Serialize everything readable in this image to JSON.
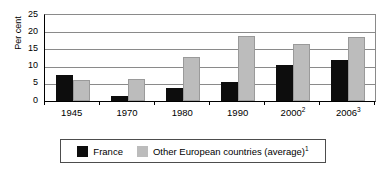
{
  "chart_data": {
    "type": "bar",
    "title": "",
    "subtitle": "",
    "xlabel": "",
    "ylabel": "Per cent",
    "ylim": [
      0,
      25
    ],
    "yticks": [
      0,
      5,
      10,
      15,
      20,
      25
    ],
    "ytick_labels": [
      "0",
      "5",
      "10",
      "15",
      "20",
      "25"
    ],
    "grid": true,
    "legend_position": "bottom",
    "categories": [
      "1945",
      "1970",
      "1980",
      "1990",
      "2000",
      "2006"
    ],
    "category_labels": [
      {
        "text": "1945",
        "sup": ""
      },
      {
        "text": "1970",
        "sup": ""
      },
      {
        "text": "1980",
        "sup": ""
      },
      {
        "text": "1990",
        "sup": ""
      },
      {
        "text": "2000",
        "sup": "2"
      },
      {
        "text": "2006",
        "sup": "3"
      }
    ],
    "series": [
      {
        "name": "France",
        "color": "#0d0d0d",
        "values": [
          7.5,
          1.5,
          3.8,
          5.5,
          10.5,
          12.0
        ]
      },
      {
        "name": "Other European countries (average)",
        "name_sup": "1",
        "color": "#bcbcbc",
        "values": [
          6.0,
          6.5,
          12.8,
          19.0,
          16.5,
          18.7
        ]
      }
    ]
  },
  "legend": {
    "entries": [
      {
        "label": "France",
        "sup": "",
        "color": "#0d0d0d"
      },
      {
        "label": "Other European countries (average)",
        "sup": "1",
        "color": "#bcbcbc"
      }
    ]
  },
  "colors": {
    "series_france": "#0d0d0d",
    "series_other": "#bcbcbc",
    "gridline": "#8a8a8a",
    "axis": "#000000",
    "legend_border": "#4d4d4d",
    "background": "#ffffff"
  }
}
